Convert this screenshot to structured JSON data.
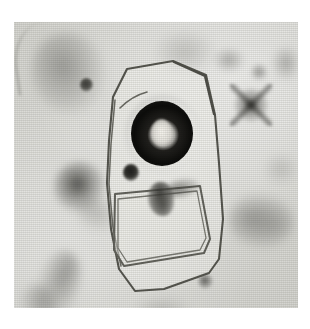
{
  "figure": {
    "kind": "photomicrograph",
    "modality": "brightfield light microscopy",
    "color_mode": "grayscale",
    "plate": {
      "left": 14,
      "top": 22,
      "width": 284,
      "height": 286,
      "background_hex": "#d6d6d1",
      "page_background_hex": "#ffffff",
      "texture": "horizontal halftone scan lines"
    },
    "subject": {
      "label": "cell",
      "outline_shape": "irregular elongated polygon",
      "outline_hex": "#5a5a55",
      "structures": [
        {
          "name": "nucleus",
          "shape": "thick dark ring (annulus)",
          "center_x": 148,
          "center_y": 111,
          "outer_diameter": 62,
          "fill_hex": "#0c0c0a"
        },
        {
          "name": "nucleolus",
          "shape": "pale oval lumen at ring centre",
          "center_x": 147,
          "center_y": 110,
          "width": 21,
          "height": 27,
          "fill_hex": "#f2f0ea"
        },
        {
          "name": "granule",
          "shape": "small dense round granule",
          "center_x": 117,
          "center_y": 150,
          "diameter": 16,
          "fill_hex": "#181816"
        },
        {
          "name": "inner-vacuole",
          "shape": "rounded square / rhomboid inclusion",
          "center_x": 146,
          "center_y": 196,
          "width": 98,
          "height": 94,
          "outline_hex": "#6b6b66"
        },
        {
          "name": "inner-inclusion",
          "shape": "irregular dark mass inside vacuole",
          "center_x": 147,
          "center_y": 177,
          "fill_hex": "#4a4a46"
        }
      ]
    },
    "background_debris": [
      {
        "name": "diffuse-smudge-top-left",
        "center_x": 55,
        "center_y": 51,
        "tone": "medium gray"
      },
      {
        "name": "dark-dot-top-left",
        "center_x": 72,
        "center_y": 63,
        "tone": "dark"
      },
      {
        "name": "diffuse-smudge-top-mid",
        "center_x": 171,
        "center_y": 30,
        "tone": "light gray"
      },
      {
        "name": "speck-top-right-upper",
        "center_x": 215,
        "center_y": 38,
        "tone": "medium gray"
      },
      {
        "name": "speck-top-right-lower",
        "center_x": 245,
        "center_y": 50,
        "tone": "medium gray"
      },
      {
        "name": "star-artifact-top-right",
        "center_x": 237,
        "center_y": 83,
        "tone": "very dark, cross-shaped"
      },
      {
        "name": "smudge-right-edge-top",
        "center_x": 272,
        "center_y": 41,
        "tone": "medium gray"
      },
      {
        "name": "dark-blob-left",
        "center_x": 66,
        "center_y": 165,
        "tone": "very dark"
      },
      {
        "name": "smudge-left-tail",
        "center_x": 84,
        "center_y": 193,
        "tone": "light gray"
      },
      {
        "name": "streak-bottom-left",
        "center_x": 43,
        "center_y": 265,
        "tone": "medium gray"
      },
      {
        "name": "streak-bottom-left-lower",
        "center_x": 24,
        "center_y": 284,
        "tone": "medium gray"
      },
      {
        "name": "cluster-bottom-right",
        "center_x": 247,
        "center_y": 199,
        "tone": "medium gray"
      },
      {
        "name": "dark-dot-bottom-right",
        "center_x": 191,
        "center_y": 259,
        "tone": "dark"
      },
      {
        "name": "hairline-bottom-right",
        "center_x": 205,
        "center_y": 203,
        "tone": "thin dark line"
      },
      {
        "name": "smudge-bottom-mid",
        "center_x": 148,
        "center_y": 289,
        "tone": "light gray"
      },
      {
        "name": "smudge-mid-right",
        "center_x": 267,
        "center_y": 147,
        "tone": "light gray"
      }
    ]
  }
}
